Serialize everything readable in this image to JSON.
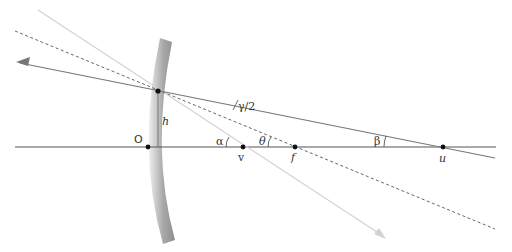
{
  "diagram": {
    "labels": {
      "origin": "O",
      "height": "h",
      "half_angle": "γ/2",
      "alpha": "α",
      "theta": "θ",
      "beta": "β",
      "point_v": "v",
      "point_f": "f",
      "point_u": "u"
    },
    "colors": {
      "axis": "#555555",
      "reflected_ray": "#777777",
      "incident_ray": "#cfcfcf",
      "normal_dashed": "#666666",
      "mirror_dark": "#9a9a9a",
      "mirror_light": "#e6e6e6",
      "points": "#111111"
    }
  }
}
